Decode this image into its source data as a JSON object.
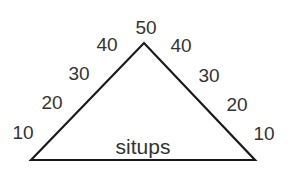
{
  "diagram": {
    "center_label": "situps",
    "apex_label": "50",
    "left_side_labels": [
      "10",
      "20",
      "30",
      "40"
    ],
    "right_side_labels": [
      "40",
      "30",
      "20",
      "10"
    ],
    "stroke_color": "#1a1a1a",
    "text_color": "#333333"
  }
}
